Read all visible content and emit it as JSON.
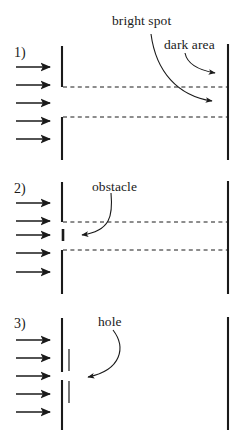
{
  "figure": {
    "background_color": "#ffffff",
    "ink_color": "#1a1a1a",
    "width": 242,
    "height": 438
  },
  "panels": [
    {
      "number": "1)",
      "case_name": "open-slit",
      "labels": [
        {
          "name": "bright-spot-label",
          "text": "bright spot"
        },
        {
          "name": "dark-area-label",
          "text": "dark area"
        }
      ],
      "elements": {
        "incident_rays": 5,
        "barrier": "vertical barrier with central slit",
        "dashed_lines": 2,
        "screen": "vertical screen at right",
        "pointer_arrows": 2
      }
    },
    {
      "number": "2)",
      "case_name": "obstacle-in-slit",
      "labels": [
        {
          "name": "obstacle-label",
          "text": "obstacle"
        }
      ],
      "elements": {
        "incident_rays": 5,
        "barrier": "vertical barrier with central slit",
        "obstacle": "short vertical bar centered in the slit",
        "dashed_lines": 2,
        "screen": "vertical screen at right",
        "pointer_arrows": 1
      }
    },
    {
      "number": "3)",
      "case_name": "small-hole",
      "labels": [
        {
          "name": "hole-label",
          "text": "hole"
        }
      ],
      "elements": {
        "incident_rays": 5,
        "barrier": "vertical barrier with small hole",
        "dashed_lines": 0,
        "screen": "vertical screen at right",
        "pointer_arrows": 1
      }
    }
  ],
  "icons": {
    "ray_arrow": "arrow-right-icon",
    "pointer_arrow": "curved-pointer-arrow-icon"
  }
}
